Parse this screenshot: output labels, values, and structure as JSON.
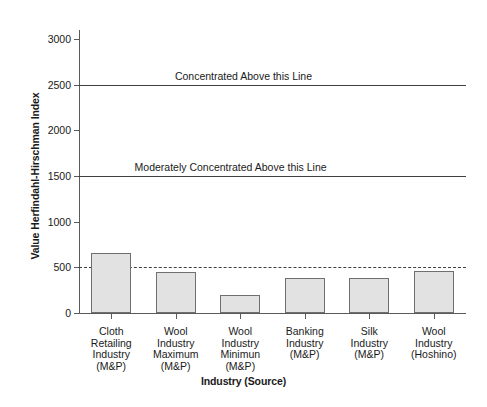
{
  "chart_data": {
    "type": "bar",
    "title": "",
    "xlabel": "Industry (Source)",
    "ylabel": "Value Herfindahl-Hirschman Index",
    "categories": [
      "Cloth\nRetailing\nIndustry\n(M&P)",
      "Wool\nIndustry\nMaximum\n(M&P)",
      "Wool\nIndustry\nMinimun\n(M&P)",
      "Banking\nIndustry\n(M&P)",
      "Silk\nIndustry\n(M&P)",
      "Wool\nIndustry\n(Hoshino)"
    ],
    "values": [
      660,
      450,
      200,
      380,
      380,
      460
    ],
    "ylim": [
      0,
      3100
    ],
    "yticks": [
      0,
      500,
      1000,
      1500,
      2000,
      2500,
      3000
    ],
    "ytick_labels": [
      "0",
      "500",
      "1000",
      "1500",
      "2000",
      "2500",
      "3000"
    ],
    "grid": false,
    "legend": null,
    "bar_fill_color": "#e2e2e2",
    "bar_edge_color": "#6f6f6f",
    "axis_color": "#5a5a5a",
    "reference_lines": [
      {
        "name": "concentrated-threshold",
        "value": 2500,
        "style": "solid",
        "color": "#3f3f3f",
        "label": "Concentrated Above this Line",
        "label_x": 2.55
      },
      {
        "name": "moderately-concentrated-threshold",
        "value": 1500,
        "style": "solid",
        "color": "#3f3f3f",
        "label": "Moderately Concentrated Above this Line",
        "label_x": 2.35
      },
      {
        "name": "five-hundred-threshold",
        "value": 500,
        "style": "dashed",
        "color": "#3f3f3f",
        "label": "",
        "label_x": 0
      }
    ]
  },
  "categories_lines": [
    [
      "Cloth",
      "Retailing",
      "Industry",
      "(M&P)"
    ],
    [
      "Wool",
      "Industry",
      "Maximum",
      "(M&P)"
    ],
    [
      "Wool",
      "Industry",
      "Minimun",
      "(M&P)"
    ],
    [
      "Banking",
      "Industry",
      "(M&P)"
    ],
    [
      "Silk",
      "Industry",
      "(M&P)"
    ],
    [
      "Wool",
      "Industry",
      "(Hoshino)"
    ]
  ]
}
